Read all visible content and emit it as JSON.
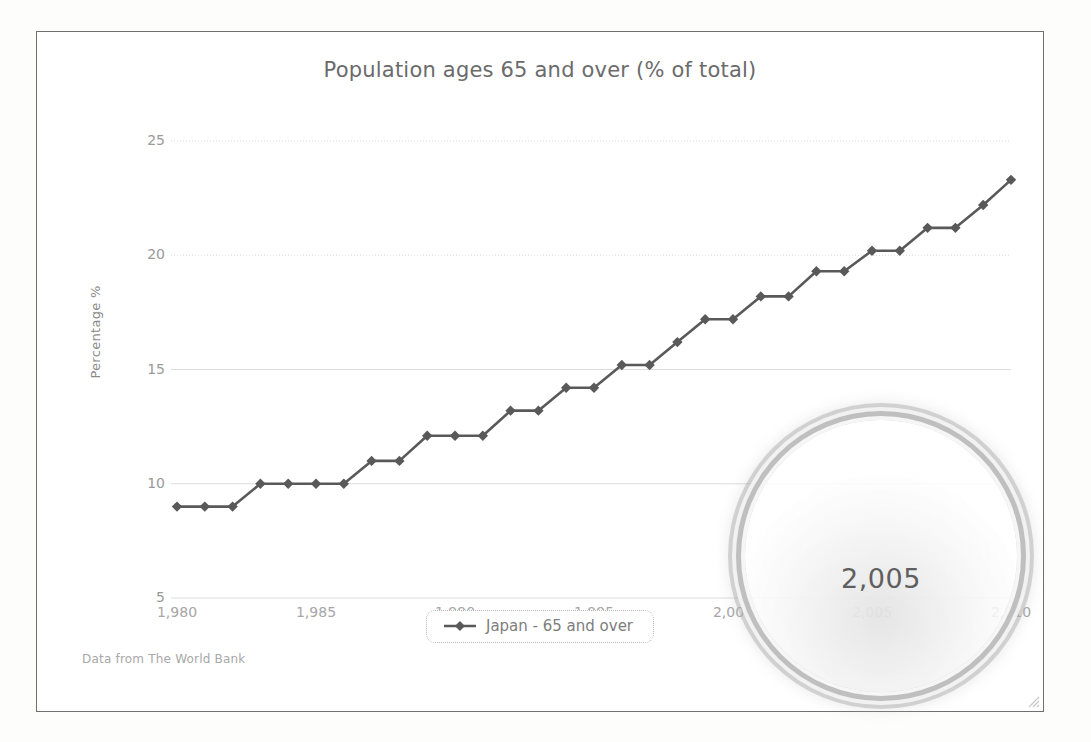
{
  "chart_title": "Population ages 65 and over (% of total)",
  "axes": {
    "ylabel": "Percentage %",
    "yticks": [
      "5",
      "10",
      "15",
      "20",
      "25"
    ],
    "xticks": [
      "1,980",
      "1,985",
      "1,990",
      "1,995",
      "2,000",
      "2,005",
      "2,010"
    ]
  },
  "legend": {
    "label": "Japan - 65 and over",
    "marker": "diamond-marker-icon"
  },
  "footer": {
    "note": "Data from The World Bank"
  },
  "magnifier": {
    "name": "magnifying-glass-lens",
    "magnified_text": "2,005"
  },
  "colors": {
    "series": "#595959",
    "gridline": "#dcdcdc",
    "axis_text": "#9a9a9a",
    "title_text": "#6b6b6b",
    "frame_border": "#6f6f6f"
  },
  "chart_data": {
    "type": "line",
    "title": "Population ages 65 and over (% of total)",
    "xlabel": "",
    "ylabel": "Percentage %",
    "xlim": [
      1980,
      2010
    ],
    "ylim": [
      5,
      25
    ],
    "grid": true,
    "legend_position": "bottom-center",
    "source": "Data from The World Bank",
    "x": [
      1980,
      1981,
      1982,
      1983,
      1984,
      1985,
      1986,
      1987,
      1988,
      1989,
      1990,
      1991,
      1992,
      1993,
      1994,
      1995,
      1996,
      1997,
      1998,
      1999,
      2000,
      2001,
      2002,
      2003,
      2004,
      2005,
      2006,
      2007,
      2008,
      2009,
      2010
    ],
    "series": [
      {
        "name": "Japan - 65 and over",
        "values": [
          9.0,
          9.0,
          9.0,
          10.0,
          10.0,
          10.0,
          10.0,
          11.0,
          11.0,
          12.1,
          12.1,
          12.1,
          13.2,
          13.2,
          14.2,
          14.2,
          15.2,
          15.2,
          16.2,
          17.2,
          17.2,
          18.2,
          18.2,
          19.3,
          19.3,
          20.2,
          20.2,
          21.2,
          21.2,
          22.2,
          23.3
        ]
      }
    ]
  }
}
